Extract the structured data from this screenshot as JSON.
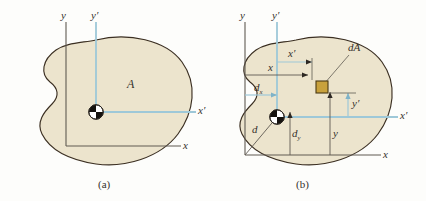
{
  "figure": {
    "colors": {
      "area_fill": "#ece4cd",
      "area_outline": "#3b2f22",
      "reference_axis": "#605a52",
      "centroidal_axis": "#9ec8d8",
      "element_fill": "#c8a13c",
      "element_outline": "#4a3a14",
      "text": "#35312c",
      "background": "#fdfdfb"
    },
    "panels": [
      {
        "id": "a",
        "caption": "(a)",
        "area_label": "A",
        "axes": [
          {
            "name": "y",
            "kind": "reference",
            "label": "y"
          },
          {
            "name": "x",
            "kind": "reference",
            "label": "x"
          },
          {
            "name": "yp",
            "kind": "centroidal",
            "label": "y′"
          },
          {
            "name": "xp",
            "kind": "centroidal",
            "label": "x′"
          }
        ],
        "centroid_marker": "centroid-symbol"
      },
      {
        "id": "b",
        "caption": "(b)",
        "element_label": "dA",
        "axes": [
          {
            "name": "y",
            "kind": "reference",
            "label": "y"
          },
          {
            "name": "x",
            "kind": "reference",
            "label": "x"
          },
          {
            "name": "yp",
            "kind": "centroidal",
            "label": "y′"
          },
          {
            "name": "xp",
            "kind": "centroidal",
            "label": "x′"
          }
        ],
        "dimensions": [
          {
            "name": "x",
            "label": "x",
            "sub": "",
            "desc": "horizontal distance from y axis to element"
          },
          {
            "name": "xp",
            "label": "x′",
            "sub": "",
            "desc": "horizontal distance from y′ axis to element"
          },
          {
            "name": "y",
            "label": "y",
            "sub": "",
            "desc": "vertical distance from x axis to element"
          },
          {
            "name": "yp",
            "label": "y′",
            "sub": "",
            "desc": "vertical distance from x′ axis to element"
          },
          {
            "name": "d",
            "label": "d",
            "sub": "",
            "desc": "distance from origin to centroid"
          },
          {
            "name": "dx",
            "label": "d",
            "sub": "x",
            "desc": "horizontal offset of centroid"
          },
          {
            "name": "dy",
            "label": "d",
            "sub": "y",
            "desc": "vertical offset of centroid"
          }
        ],
        "centroid_marker": "centroid-symbol"
      }
    ]
  }
}
